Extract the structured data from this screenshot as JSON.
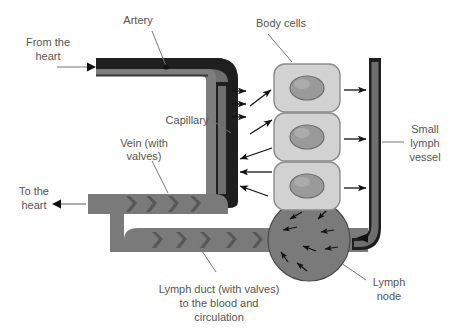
{
  "diagram": {
    "background_color": "#ffffff",
    "text_color": "#555555",
    "colors": {
      "artery_fill": "#6e6e6e",
      "artery_wall": "#1a1a1a",
      "vein_fill": "#7a7a7a",
      "vein_valve": "#5a5a5a",
      "capillary_fill": "#6e6e6e",
      "capillary_wall": "#1a1a1a",
      "lymph_vessel_fill": "#6a6a6a",
      "lymph_vessel_wall": "#1a1a1a",
      "lymph_duct_fill": "#7a7a7a",
      "lymph_node_fill": "#7a7a7a",
      "cell_fill": "#d2d2d2",
      "cell_border": "#8c8c8c",
      "nucleus_fill": "#9a9a9a",
      "nucleus_border": "#6e6e6e",
      "arrow_color": "#111111",
      "leader_color": "#777777"
    },
    "labels": [
      {
        "id": "from-the-heart",
        "lines": [
          "From the",
          "heart"
        ],
        "x": 48,
        "y": 46,
        "anchor": "middle"
      },
      {
        "id": "artery",
        "lines": [
          "Artery"
        ],
        "x": 138,
        "y": 24,
        "anchor": "middle"
      },
      {
        "id": "capillary",
        "lines": [
          "Capillary"
        ],
        "x": 187,
        "y": 124,
        "anchor": "middle"
      },
      {
        "id": "vein-with-valves",
        "lines": [
          "Vein (with",
          "valves)"
        ],
        "x": 144,
        "y": 147,
        "anchor": "middle"
      },
      {
        "id": "to-the-heart",
        "lines": [
          "To the",
          "heart"
        ],
        "x": 34,
        "y": 195,
        "anchor": "middle"
      },
      {
        "id": "body-cells",
        "lines": [
          "Body cells"
        ],
        "x": 281,
        "y": 27,
        "anchor": "middle"
      },
      {
        "id": "small-lymph-vessel",
        "lines": [
          "Small",
          "lymph",
          "vessel"
        ],
        "x": 425,
        "y": 133,
        "anchor": "middle"
      },
      {
        "id": "lymph-node",
        "lines": [
          "Lymph",
          "node"
        ],
        "x": 389,
        "y": 286,
        "anchor": "middle"
      },
      {
        "id": "lymph-duct",
        "lines": [
          "Lymph duct (with valves)",
          "to the blood and",
          "circulation"
        ],
        "x": 219,
        "y": 293,
        "anchor": "middle"
      }
    ],
    "structures": [
      {
        "id": "artery",
        "name": "Artery",
        "description": "Thick-walled vessel entering from the left from the heart, turning down on the right"
      },
      {
        "id": "capillary",
        "name": "Capillary",
        "description": "Narrow vertical vessel connecting artery to vein with fluid leaking out to body cells"
      },
      {
        "id": "vein",
        "name": "Vein (with valves)",
        "description": "Valved vessel returning blood to the heart at the left"
      },
      {
        "id": "body-cells",
        "name": "Body cells",
        "description": "Three stacked rounded cells each containing a nucleus"
      },
      {
        "id": "small-lymph-vessel",
        "name": "Small lymph vessel",
        "description": "Vertical lymph capillary on the right collecting tissue fluid"
      },
      {
        "id": "lymph-node",
        "name": "Lymph node",
        "description": "Circular node on the lymph duct with internal arrows"
      },
      {
        "id": "lymph-duct",
        "name": "Lymph duct (with valves) to the blood and circulation",
        "description": "Valved duct returning lymph to the bloodstream"
      }
    ],
    "flow_arrows": {
      "capillary_to_cells_count": 3,
      "cells_to_capillary_count": 3,
      "cells_to_lymph_vessel_count": 3,
      "lymph_node_internal_count": 8
    }
  }
}
